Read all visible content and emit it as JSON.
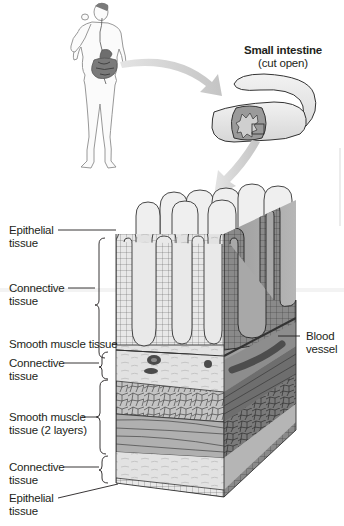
{
  "figure": {
    "type": "anatomical-diagram"
  },
  "inset": {
    "title": "Small intestine",
    "subtitle": "(cut open)"
  },
  "labels": {
    "left": [
      {
        "id": "epithelial-top",
        "line1": "Epithelial",
        "line2": "tissue"
      },
      {
        "id": "connective-1",
        "line1": "Connective",
        "line2": "tissue"
      },
      {
        "id": "smooth-muscle-1",
        "line1": "Smooth muscle tissue",
        "line2": ""
      },
      {
        "id": "connective-2",
        "line1": "Connective",
        "line2": "tissue"
      },
      {
        "id": "smooth-muscle-2",
        "line1": "Smooth muscle",
        "line2": "tissue (2 layers)"
      },
      {
        "id": "connective-3",
        "line1": "Connective",
        "line2": "tissue"
      },
      {
        "id": "epithelial-bottom",
        "line1": "Epithelial",
        "line2": "tissue"
      }
    ],
    "right": [
      {
        "id": "blood-vessel",
        "line1": "Blood",
        "line2": "vessel"
      }
    ]
  },
  "colors": {
    "ink": "#231f20",
    "arrow": "#c9c9c9",
    "villus_fill": "#e6e6e6",
    "connective": "#dcdcdc",
    "muscle_front": "#b5b5b5",
    "muscle_side": "#7d7d7d",
    "vessel": "#5a5a5a"
  }
}
